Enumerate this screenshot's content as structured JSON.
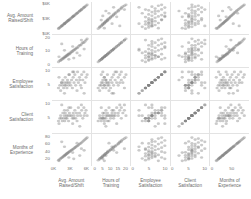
{
  "chart_data": {
    "type": "scatter",
    "title": "",
    "subtitle": "",
    "layout": "scatter-plot-matrix",
    "grid": false,
    "legend_position": "none",
    "marker": {
      "shape": "circle",
      "color": "#808080",
      "opacity": 0.42,
      "size": 2.2
    },
    "variables": [
      {
        "key": "avg_amount_raised_shift",
        "label_lines": [
          "Avg. Amount",
          "Raised/Shift"
        ],
        "axis_label": "Avg. Amount Raised/Shift",
        "ylim": [
          0,
          6500
        ],
        "xlim": [
          0,
          6500
        ],
        "ytick_labels": [
          "$6K",
          "$3K",
          "$0K"
        ],
        "ytick_values": [
          6000,
          3000,
          0
        ],
        "xtick_labels": [
          "0K",
          "3K",
          "6K"
        ],
        "xtick_values": [
          0,
          3000,
          6000
        ]
      },
      {
        "key": "hours_of_training",
        "label_lines": [
          "Hours of",
          "Training"
        ],
        "axis_label": "Hours of Training",
        "ylim": [
          -1,
          22
        ],
        "xlim": [
          -1,
          22
        ],
        "ytick_labels": [
          "20",
          "10",
          "0"
        ],
        "ytick_values": [
          20,
          10,
          0
        ],
        "xtick_labels": [
          "0",
          "5",
          "10",
          "15",
          "20"
        ],
        "xtick_values": [
          0,
          5,
          10,
          15,
          20
        ]
      },
      {
        "key": "employee_satisfaction",
        "label_lines": [
          "Employee",
          "Satisfaction"
        ],
        "axis_label": "Employee Satisfaction",
        "ylim": [
          0,
          11
        ],
        "xlim": [
          0,
          11
        ],
        "ytick_labels": [
          "10",
          "5"
        ],
        "ytick_values": [
          10,
          5
        ],
        "xtick_labels": [
          "0",
          "5",
          "10"
        ],
        "xtick_values": [
          0,
          5,
          10
        ]
      },
      {
        "key": "client_satisfaction",
        "label_lines": [
          "Client",
          "Satisfaction"
        ],
        "axis_label": "Client Satisfaction",
        "ylim": [
          0,
          11
        ],
        "xlim": [
          0,
          11
        ],
        "ytick_labels": [
          "10",
          "5"
        ],
        "ytick_values": [
          10,
          5
        ],
        "xtick_labels": [
          "0",
          "5",
          "10"
        ],
        "xtick_values": [
          0,
          5,
          10
        ]
      },
      {
        "key": "months_of_experience",
        "label_lines": [
          "Months of",
          "Experience"
        ],
        "axis_label": "Months of Experience",
        "ylim": [
          0,
          90
        ],
        "xlim": [
          0,
          90
        ],
        "ytick_labels": [
          "80",
          "60",
          "40",
          "20"
        ],
        "ytick_values": [
          80,
          60,
          40,
          20
        ],
        "xtick_labels": [
          "0",
          "50"
        ],
        "xtick_values": [
          0,
          50
        ]
      }
    ],
    "points": [
      {
        "avg_amount_raised_shift": 900,
        "hours_of_training": 2,
        "employee_satisfaction": 4,
        "client_satisfaction": 4,
        "months_of_experience": 14
      },
      {
        "avg_amount_raised_shift": 1150,
        "hours_of_training": 3,
        "employee_satisfaction": 5,
        "client_satisfaction": 5,
        "months_of_experience": 17
      },
      {
        "avg_amount_raised_shift": 1300,
        "hours_of_training": 3,
        "employee_satisfaction": 3,
        "client_satisfaction": 6,
        "months_of_experience": 19
      },
      {
        "avg_amount_raised_shift": 1450,
        "hours_of_training": 4,
        "employee_satisfaction": 6,
        "client_satisfaction": 5,
        "months_of_experience": 21
      },
      {
        "avg_amount_raised_shift": 1600,
        "hours_of_training": 4,
        "employee_satisfaction": 5,
        "client_satisfaction": 4,
        "months_of_experience": 22
      },
      {
        "avg_amount_raised_shift": 1700,
        "hours_of_training": 5,
        "employee_satisfaction": 7,
        "client_satisfaction": 7,
        "months_of_experience": 24
      },
      {
        "avg_amount_raised_shift": 1850,
        "hours_of_training": 5,
        "employee_satisfaction": 4,
        "client_satisfaction": 5,
        "months_of_experience": 26
      },
      {
        "avg_amount_raised_shift": 1950,
        "hours_of_training": 5,
        "employee_satisfaction": 6,
        "client_satisfaction": 6,
        "months_of_experience": 27
      },
      {
        "avg_amount_raised_shift": 2050,
        "hours_of_training": 6,
        "employee_satisfaction": 5,
        "client_satisfaction": 4,
        "months_of_experience": 29
      },
      {
        "avg_amount_raised_shift": 2150,
        "hours_of_training": 6,
        "employee_satisfaction": 8,
        "client_satisfaction": 7,
        "months_of_experience": 30
      },
      {
        "avg_amount_raised_shift": 2250,
        "hours_of_training": 6,
        "employee_satisfaction": 5,
        "client_satisfaction": 5,
        "months_of_experience": 31
      },
      {
        "avg_amount_raised_shift": 2350,
        "hours_of_training": 7,
        "employee_satisfaction": 6,
        "client_satisfaction": 6,
        "months_of_experience": 33
      },
      {
        "avg_amount_raised_shift": 2450,
        "hours_of_training": 7,
        "employee_satisfaction": 4,
        "client_satisfaction": 5,
        "months_of_experience": 34
      },
      {
        "avg_amount_raised_shift": 2550,
        "hours_of_training": 7,
        "employee_satisfaction": 7,
        "client_satisfaction": 8,
        "months_of_experience": 35
      },
      {
        "avg_amount_raised_shift": 2650,
        "hours_of_training": 8,
        "employee_satisfaction": 6,
        "client_satisfaction": 6,
        "months_of_experience": 37
      },
      {
        "avg_amount_raised_shift": 2750,
        "hours_of_training": 8,
        "employee_satisfaction": 5,
        "client_satisfaction": 4,
        "months_of_experience": 38
      },
      {
        "avg_amount_raised_shift": 2900,
        "hours_of_training": 8,
        "employee_satisfaction": 9,
        "client_satisfaction": 7,
        "months_of_experience": 40
      },
      {
        "avg_amount_raised_shift": 3000,
        "hours_of_training": 9,
        "employee_satisfaction": 6,
        "client_satisfaction": 6,
        "months_of_experience": 41
      },
      {
        "avg_amount_raised_shift": 3150,
        "hours_of_training": 9,
        "employee_satisfaction": 5,
        "client_satisfaction": 9,
        "months_of_experience": 43
      },
      {
        "avg_amount_raised_shift": 3300,
        "hours_of_training": 10,
        "employee_satisfaction": 7,
        "client_satisfaction": 6,
        "months_of_experience": 45
      },
      {
        "avg_amount_raised_shift": 3450,
        "hours_of_training": 10,
        "employee_satisfaction": 4,
        "client_satisfaction": 5,
        "months_of_experience": 46
      },
      {
        "avg_amount_raised_shift": 3600,
        "hours_of_training": 11,
        "employee_satisfaction": 8,
        "client_satisfaction": 7,
        "months_of_experience": 48
      },
      {
        "avg_amount_raised_shift": 3750,
        "hours_of_training": 11,
        "employee_satisfaction": 6,
        "client_satisfaction": 6,
        "months_of_experience": 50
      },
      {
        "avg_amount_raised_shift": 3900,
        "hours_of_training": 12,
        "employee_satisfaction": 9,
        "client_satisfaction": 8,
        "months_of_experience": 52
      },
      {
        "avg_amount_raised_shift": 4050,
        "hours_of_training": 12,
        "employee_satisfaction": 5,
        "client_satisfaction": 5,
        "months_of_experience": 54
      },
      {
        "avg_amount_raised_shift": 4200,
        "hours_of_training": 13,
        "employee_satisfaction": 7,
        "client_satisfaction": 7,
        "months_of_experience": 56
      },
      {
        "avg_amount_raised_shift": 4400,
        "hours_of_training": 13,
        "employee_satisfaction": 10,
        "client_satisfaction": 6,
        "months_of_experience": 58
      },
      {
        "avg_amount_raised_shift": 4550,
        "hours_of_training": 14,
        "employee_satisfaction": 6,
        "client_satisfaction": 9,
        "months_of_experience": 60
      },
      {
        "avg_amount_raised_shift": 4750,
        "hours_of_training": 15,
        "employee_satisfaction": 8,
        "client_satisfaction": 7,
        "months_of_experience": 63
      },
      {
        "avg_amount_raised_shift": 4950,
        "hours_of_training": 15,
        "employee_satisfaction": 5,
        "client_satisfaction": 6,
        "months_of_experience": 65
      },
      {
        "avg_amount_raised_shift": 5150,
        "hours_of_training": 16,
        "employee_satisfaction": 9,
        "client_satisfaction": 8,
        "months_of_experience": 68
      },
      {
        "avg_amount_raised_shift": 5350,
        "hours_of_training": 17,
        "employee_satisfaction": 7,
        "client_satisfaction": 5,
        "months_of_experience": 71
      },
      {
        "avg_amount_raised_shift": 5550,
        "hours_of_training": 17,
        "employee_satisfaction": 10,
        "client_satisfaction": 9,
        "months_of_experience": 74
      },
      {
        "avg_amount_raised_shift": 5750,
        "hours_of_training": 18,
        "employee_satisfaction": 6,
        "client_satisfaction": 7,
        "months_of_experience": 77
      },
      {
        "avg_amount_raised_shift": 5950,
        "hours_of_training": 19,
        "employee_satisfaction": 8,
        "client_satisfaction": 8,
        "months_of_experience": 80
      },
      {
        "avg_amount_raised_shift": 6150,
        "hours_of_training": 20,
        "employee_satisfaction": 9,
        "client_satisfaction": 6,
        "months_of_experience": 83
      },
      {
        "avg_amount_raised_shift": 1000,
        "hours_of_training": 6,
        "employee_satisfaction": 8,
        "client_satisfaction": 3,
        "months_of_experience": 12
      },
      {
        "avg_amount_raised_shift": 2800,
        "hours_of_training": 4,
        "employee_satisfaction": 9,
        "client_satisfaction": 9,
        "months_of_experience": 22
      },
      {
        "avg_amount_raised_shift": 4300,
        "hours_of_training": 9,
        "employee_satisfaction": 3,
        "client_satisfaction": 4,
        "months_of_experience": 66
      },
      {
        "avg_amount_raised_shift": 5100,
        "hours_of_training": 19,
        "employee_satisfaction": 4,
        "client_satisfaction": 10,
        "months_of_experience": 49
      },
      {
        "avg_amount_raised_shift": 3500,
        "hours_of_training": 14,
        "employee_satisfaction": 10,
        "client_satisfaction": 3,
        "months_of_experience": 37
      },
      {
        "avg_amount_raised_shift": 2000,
        "hours_of_training": 11,
        "employee_satisfaction": 2,
        "client_satisfaction": 8,
        "months_of_experience": 55
      },
      {
        "avg_amount_raised_shift": 4800,
        "hours_of_training": 7,
        "employee_satisfaction": 7,
        "client_satisfaction": 2,
        "months_of_experience": 28
      },
      {
        "avg_amount_raised_shift": 1500,
        "hours_of_training": 16,
        "employee_satisfaction": 6,
        "client_satisfaction": 10,
        "months_of_experience": 70
      },
      {
        "avg_amount_raised_shift": 5600,
        "hours_of_training": 12,
        "employee_satisfaction": 2,
        "client_satisfaction": 6,
        "months_of_experience": 44
      },
      {
        "avg_amount_raised_shift": 3700,
        "hours_of_training": 5,
        "employee_satisfaction": 10,
        "client_satisfaction": 5,
        "months_of_experience": 18
      }
    ]
  }
}
